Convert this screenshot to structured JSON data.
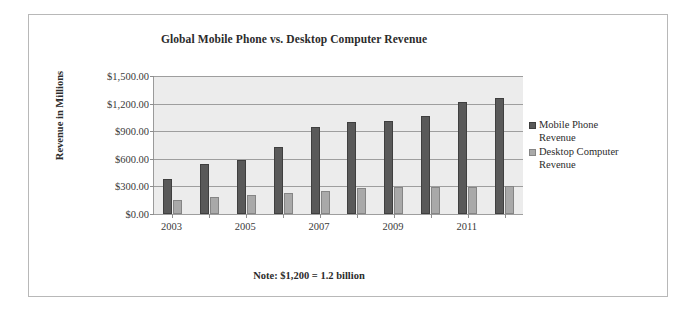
{
  "chart_data": {
    "type": "bar",
    "title": "Global Mobile Phone vs. Desktop Computer Revenue",
    "xlabel": "",
    "ylabel": "Revenue in Millions",
    "ylim": [
      0,
      1500
    ],
    "ytick_labels": [
      "$1,500.00",
      "$1,200.00",
      "$900.00",
      "$600.00",
      "$300.00",
      "$0.00"
    ],
    "ytick_values": [
      1500,
      1200,
      900,
      600,
      300,
      0
    ],
    "grid": true,
    "legend_position": "right",
    "categories": [
      "2003",
      "2004",
      "2005",
      "2006",
      "2007",
      "2008",
      "2009",
      "2010",
      "2011",
      "2012"
    ],
    "xtick_labels": [
      "2003",
      "",
      "2005",
      "",
      "2007",
      "",
      "2009",
      "",
      "2011",
      ""
    ],
    "series": [
      {
        "name": "Mobile Phone Revenue",
        "color": "#595959",
        "values": [
          380,
          540,
          585,
          730,
          950,
          1000,
          1010,
          1065,
          1215,
          1265
        ]
      },
      {
        "name": "Desktop Computer Revenue",
        "color": "#a9a9a9",
        "values": [
          150,
          185,
          205,
          225,
          255,
          285,
          295,
          295,
          295,
          300
        ]
      }
    ],
    "note": "Note: $1,200 = 1.2 billion"
  },
  "legend": {
    "items": [
      {
        "label_line1": "Mobile Phone",
        "label_line2": "Revenue"
      },
      {
        "label_line1": "Desktop Computer",
        "label_line2": "Revenue"
      }
    ]
  }
}
